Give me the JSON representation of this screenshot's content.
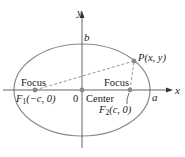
{
  "diagram": {
    "axes": {
      "x_label": "x",
      "y_label": "y",
      "origin_label": "0"
    },
    "ellipse": {
      "semi_major_label": "a",
      "semi_minor_label": "b",
      "center_label": "Center"
    },
    "foci": [
      {
        "tag": "Focus",
        "name_main": "F",
        "name_sub": "1",
        "coords": "(−c, 0)"
      },
      {
        "tag": "Focus",
        "name_main": "F",
        "name_sub": "2",
        "coords": "(c, 0)"
      }
    ],
    "point": {
      "label": "P(x, y)"
    },
    "colors": {
      "ellipse": "#8a8a8a",
      "axis": "#555555",
      "point": "#8a8a8a",
      "dash": "#8a8a8a"
    }
  }
}
